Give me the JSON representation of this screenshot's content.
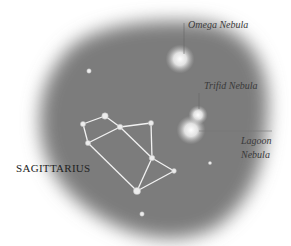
{
  "diagram": {
    "title": "SAGITTARIUS",
    "colors": {
      "sky": "#7b7b7b",
      "star": "#ececec",
      "line": "#f2f2f2",
      "label": "#3a3a3a",
      "leader": "#555555"
    },
    "constellation_stars": [
      {
        "id": "A",
        "x": 83,
        "y": 124,
        "r": 2.6
      },
      {
        "id": "B",
        "x": 105,
        "y": 116,
        "r": 3.2
      },
      {
        "id": "C",
        "x": 120,
        "y": 127,
        "r": 2.8
      },
      {
        "id": "D",
        "x": 151,
        "y": 123,
        "r": 2.6
      },
      {
        "id": "E",
        "x": 88,
        "y": 143,
        "r": 2.6
      },
      {
        "id": "F",
        "x": 152,
        "y": 158,
        "r": 2.8
      },
      {
        "id": "G",
        "x": 174,
        "y": 171,
        "r": 2.4
      },
      {
        "id": "H",
        "x": 137,
        "y": 191,
        "r": 3.6
      }
    ],
    "edges": [
      [
        "A",
        "B"
      ],
      [
        "B",
        "C"
      ],
      [
        "C",
        "D"
      ],
      [
        "A",
        "E"
      ],
      [
        "E",
        "C"
      ],
      [
        "C",
        "F"
      ],
      [
        "D",
        "F"
      ],
      [
        "F",
        "G"
      ],
      [
        "F",
        "H"
      ],
      [
        "E",
        "H"
      ],
      [
        "G",
        "H"
      ]
    ],
    "field_stars": [
      {
        "x": 89,
        "y": 71,
        "r": 2.2
      },
      {
        "x": 142,
        "y": 214,
        "r": 2.2
      },
      {
        "x": 210,
        "y": 163,
        "r": 1.6
      }
    ],
    "nebulae": [
      {
        "name": "Omega Nebula",
        "x": 180,
        "y": 59,
        "r": 9
      },
      {
        "name": "Trifid Nebula",
        "x": 198,
        "y": 115,
        "r": 6
      },
      {
        "name": "Lagoon Nebula",
        "x": 191,
        "y": 130,
        "r": 9
      }
    ],
    "labels": {
      "omega": "Omega Nebula",
      "trifid": "Trifid Nebula",
      "lagoon_line1": "Lagoon",
      "lagoon_line2": "Nebula"
    }
  }
}
